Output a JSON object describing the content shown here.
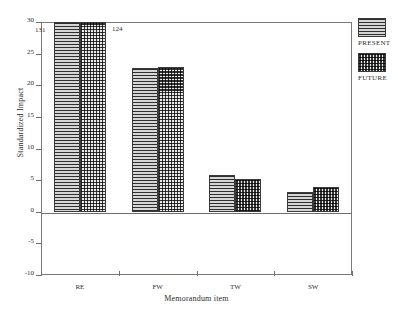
{
  "chart_data": {
    "type": "bar",
    "title": "",
    "xlabel": "Memorandum item",
    "ylabel": "Standardized Impact",
    "categories": [
      "RE",
      "FW",
      "TW",
      "SW"
    ],
    "series": [
      {
        "name": "PRESENT",
        "pattern": "horizontal-lines",
        "values": [
          131,
          22.8,
          5.8,
          3.2
        ]
      },
      {
        "name": "FUTURE",
        "pattern": "checkerboard",
        "values": [
          124,
          22.9,
          5.2,
          3.9
        ]
      }
    ],
    "ylim": [
      -10,
      30
    ],
    "yticks": [
      "30",
      "25",
      "20",
      "15",
      "10",
      "5",
      "0",
      "-5",
      "-10"
    ],
    "ytick_values": [
      30,
      25,
      20,
      15,
      10,
      5,
      0,
      -5,
      -10
    ],
    "clipped_bars": [
      {
        "category": "RE",
        "series": "PRESENT",
        "label": "131",
        "clipped_at": 30
      },
      {
        "category": "RE",
        "series": "FUTURE",
        "label": "124",
        "clipped_at": 30
      }
    ],
    "grid": false,
    "legend_position": "right-top",
    "axis_color": "#6e6e6e",
    "bar_edge_color": "#3a3a3a"
  },
  "legend": {
    "entries": [
      {
        "label": "PRESENT"
      },
      {
        "label": "FUTURE"
      }
    ]
  }
}
